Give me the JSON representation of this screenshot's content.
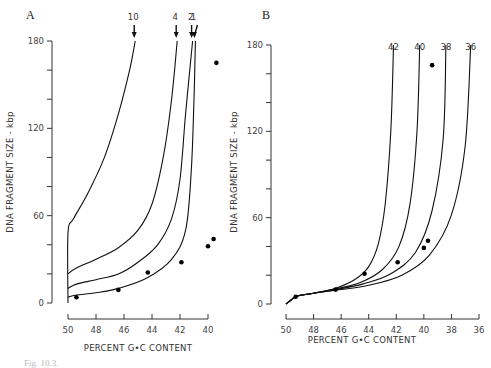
{
  "caption_fragment": "Fig. 10.3.",
  "chart_data": [
    {
      "panel": "A",
      "type": "line",
      "xlabel": "PERCENT  G•C  CONTENT",
      "ylabel": "DNA  FRAGMENT  SIZE  -  kbp",
      "xlim": [
        50,
        40
      ],
      "ylim": [
        0,
        180
      ],
      "xticks": [
        50,
        48,
        46,
        44,
        42,
        40
      ],
      "yticks": [
        0,
        20,
        40,
        60,
        80,
        100,
        120,
        140,
        160,
        180
      ],
      "ytick_labels": [
        "0",
        "",
        "",
        "60",
        "",
        "",
        "120",
        "",
        "",
        "180"
      ],
      "grid": false,
      "series": [
        {
          "name": "10",
          "label_arrow": true,
          "x": [
            50,
            50,
            49.6,
            48.6,
            47.4,
            46.4,
            45.6,
            45.2
          ],
          "y": [
            0,
            48,
            58,
            75,
            100,
            130,
            160,
            180
          ]
        },
        {
          "name": "4",
          "label_arrow": true,
          "x": [
            50,
            49.4,
            48,
            46.4,
            45,
            44,
            43.2,
            42.6,
            42.2
          ],
          "y": [
            20,
            24,
            30,
            38,
            50,
            68,
            100,
            140,
            180
          ]
        },
        {
          "name": "2",
          "label_arrow": true,
          "x": [
            50,
            49.4,
            48,
            46.4,
            45,
            43.6,
            42.6,
            42,
            41.6,
            41.1
          ],
          "y": [
            10,
            13,
            16,
            20,
            28,
            40,
            58,
            85,
            130,
            180
          ]
        },
        {
          "name": "1",
          "label_arrow": true,
          "x": [
            50,
            49.4,
            48,
            46.4,
            44.4,
            42.6,
            41.6,
            41.2,
            41,
            40.9
          ],
          "y": [
            4,
            5.5,
            7,
            10,
            17,
            30,
            50,
            90,
            140,
            180
          ]
        }
      ],
      "points": {
        "x": [
          49.4,
          46.4,
          44.3,
          41.9,
          40.0,
          39.6,
          39.4
        ],
        "y": [
          4,
          9,
          21,
          28,
          39,
          44,
          165
        ]
      }
    },
    {
      "panel": "B",
      "type": "line",
      "xlabel": "PERCENT  G•C  CONTENT",
      "ylabel": "DNA  FRAGMENT  SIZE  -  kbp",
      "xlim": [
        50,
        36
      ],
      "ylim": [
        0,
        180
      ],
      "xticks": [
        50,
        48,
        46,
        44,
        42,
        40,
        38,
        36
      ],
      "yticks": [
        0,
        20,
        40,
        60,
        80,
        100,
        120,
        140,
        160,
        180
      ],
      "ytick_labels": [
        "0",
        "",
        "",
        "60",
        "",
        "",
        "120",
        "",
        "",
        "180"
      ],
      "grid": false,
      "series": [
        {
          "name": "42",
          "x": [
            50,
            49.6,
            49.2,
            48,
            46.4,
            45,
            44,
            43.3,
            42.8,
            42.4,
            42.2
          ],
          "y": [
            0,
            3,
            5.5,
            7.5,
            11,
            17,
            26,
            42,
            70,
            120,
            180
          ]
        },
        {
          "name": "40",
          "x": [
            50,
            49.6,
            49.2,
            48,
            46.4,
            44.6,
            43,
            41.8,
            41,
            40.5,
            40.3
          ],
          "y": [
            0,
            3,
            5.5,
            7.5,
            10.5,
            15,
            24,
            40,
            70,
            120,
            180
          ]
        },
        {
          "name": "38",
          "x": [
            50,
            49.6,
            49.2,
            48,
            46.4,
            44.4,
            42.4,
            40.6,
            39.4,
            38.6,
            38.4
          ],
          "y": [
            0,
            3,
            5.5,
            7.5,
            10,
            14,
            21,
            36,
            65,
            115,
            180
          ]
        },
        {
          "name": "36",
          "x": [
            50,
            49.6,
            49.2,
            48,
            46.4,
            44,
            41.6,
            39.6,
            38,
            37,
            36.6
          ],
          "y": [
            0,
            3,
            5.5,
            7.5,
            9.5,
            13,
            20,
            34,
            62,
            110,
            180
          ]
        }
      ],
      "points": {
        "x": [
          49.3,
          46.4,
          44.3,
          41.9,
          40.0,
          39.7,
          39.4
        ],
        "y": [
          5,
          10,
          21,
          29,
          39,
          44,
          166
        ]
      }
    }
  ]
}
